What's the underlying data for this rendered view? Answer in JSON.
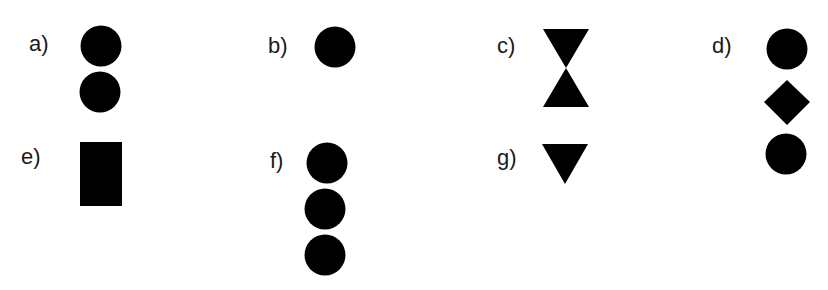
{
  "figure": {
    "fill_color": "#000000",
    "items": [
      {
        "label": "a)",
        "shapes": [
          "circle",
          "circle"
        ]
      },
      {
        "label": "b)",
        "shapes": [
          "circle"
        ]
      },
      {
        "label": "c)",
        "shapes": [
          "downward-triangle",
          "upward-triangle"
        ]
      },
      {
        "label": "d)",
        "shapes": [
          "circle",
          "diamond",
          "circle"
        ]
      },
      {
        "label": "e)",
        "shapes": [
          "rectangle"
        ]
      },
      {
        "label": "f)",
        "shapes": [
          "circle",
          "circle",
          "circle"
        ]
      },
      {
        "label": "g)",
        "shapes": [
          "downward-triangle"
        ]
      }
    ]
  }
}
